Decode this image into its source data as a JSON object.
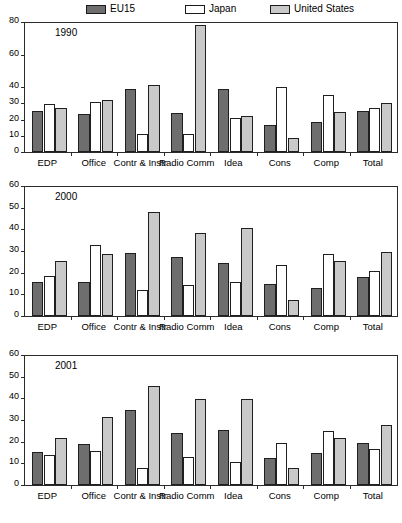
{
  "legend": {
    "items": [
      {
        "label": "EU15",
        "color": "#6e6e6e",
        "icon": "legend-swatch-eu15"
      },
      {
        "label": "Japan",
        "color": "#ffffff",
        "icon": "legend-swatch-japan"
      },
      {
        "label": "United States",
        "color": "#c9c9c9",
        "icon": "legend-swatch-united-states"
      }
    ]
  },
  "chart_data": [
    {
      "type": "bar",
      "title": "1990",
      "xlabel": "",
      "ylabel": "",
      "ylim": [
        0,
        80
      ],
      "yticks": [
        0,
        10,
        20,
        30,
        40,
        60,
        80
      ],
      "ytick_labels": [
        "0",
        "10",
        "20",
        "30",
        "40",
        "60",
        "80"
      ],
      "grid": false,
      "legend_position": "top",
      "categories": [
        "EDP",
        "Office",
        "Contr & Instr",
        "Radio Comm",
        "Idea",
        "Cons",
        "Comp",
        "Total"
      ],
      "series": [
        {
          "name": "EU15",
          "values": [
            25.5,
            23.5,
            39.0,
            23.8,
            38.6,
            16.8,
            18.3,
            25.0
          ]
        },
        {
          "name": "Japan",
          "values": [
            29.8,
            30.5,
            11.2,
            11.2,
            21.2,
            40.2,
            35.0,
            27.0
          ]
        },
        {
          "name": "United States",
          "values": [
            27.3,
            32.0,
            41.0,
            78.0,
            22.4,
            8.6,
            24.8,
            30.0
          ]
        }
      ]
    },
    {
      "type": "bar",
      "title": "2000",
      "xlabel": "",
      "ylabel": "",
      "ylim": [
        0,
        60
      ],
      "yticks": [
        0,
        10,
        20,
        30,
        40,
        50,
        60
      ],
      "ytick_labels": [
        "0",
        "10",
        "20",
        "30",
        "40",
        "50",
        "60"
      ],
      "grid": false,
      "legend_position": "top",
      "categories": [
        "EDP",
        "Office",
        "Contr & Instr",
        "Radio Comm",
        "Idea",
        "Cons",
        "Comp",
        "Total"
      ],
      "series": [
        {
          "name": "EU15",
          "values": [
            15.5,
            15.7,
            29.3,
            27.2,
            24.6,
            14.7,
            13.0,
            18.2
          ]
        },
        {
          "name": "Japan",
          "values": [
            18.5,
            33.0,
            12.0,
            14.5,
            15.6,
            23.5,
            28.6,
            20.7
          ]
        },
        {
          "name": "United States",
          "values": [
            25.4,
            28.4,
            48.2,
            38.2,
            40.5,
            7.5,
            25.5,
            29.5
          ]
        }
      ]
    },
    {
      "type": "bar",
      "title": "2001",
      "xlabel": "",
      "ylabel": "",
      "ylim": [
        0,
        60
      ],
      "yticks": [
        0,
        10,
        20,
        30,
        40,
        50,
        60
      ],
      "ytick_labels": [
        "0",
        "10",
        "20",
        "30",
        "40",
        "50",
        "60"
      ],
      "grid": false,
      "legend_position": "top",
      "categories": [
        "EDP",
        "Office",
        "Contr & Instr",
        "Radio Comm",
        "Idea",
        "Cons",
        "Comp",
        "Total"
      ],
      "series": [
        {
          "name": "EU15",
          "values": [
            15.4,
            18.9,
            34.7,
            24.2,
            25.6,
            12.5,
            15.0,
            19.4
          ]
        },
        {
          "name": "Japan",
          "values": [
            13.8,
            15.6,
            7.9,
            12.8,
            10.5,
            19.4,
            25.0,
            16.7
          ]
        },
        {
          "name": "United States",
          "values": [
            21.9,
            31.3,
            45.5,
            39.6,
            39.6,
            7.9,
            21.5,
            27.6
          ]
        }
      ]
    }
  ]
}
